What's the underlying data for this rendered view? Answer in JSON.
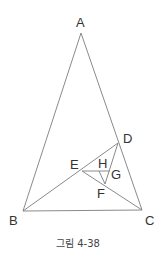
{
  "figure": {
    "caption": "그림 4-38",
    "line_color": "#8a8a8a",
    "label_color": "#333333",
    "points": {
      "A": {
        "label": "A",
        "x": 81,
        "y": 33
      },
      "B": {
        "label": "B",
        "x": 23,
        "y": 211
      },
      "C": {
        "label": "C",
        "x": 142,
        "y": 210
      },
      "D": {
        "label": "D",
        "x": 118,
        "y": 143
      },
      "E": {
        "label": "E",
        "x": 82,
        "y": 171
      },
      "F": {
        "label": "F",
        "x": 105,
        "y": 184
      },
      "G": {
        "label": "G",
        "x": 110,
        "y": 171
      },
      "H": {
        "label": "H",
        "x": 99,
        "y": 171
      }
    },
    "segments": [
      [
        "A",
        "B"
      ],
      [
        "A",
        "C"
      ],
      [
        "B",
        "C"
      ],
      [
        "B",
        "D"
      ],
      [
        "C",
        "E"
      ],
      [
        "E",
        "G"
      ],
      [
        "D",
        "F"
      ],
      [
        "H",
        "F"
      ]
    ]
  }
}
